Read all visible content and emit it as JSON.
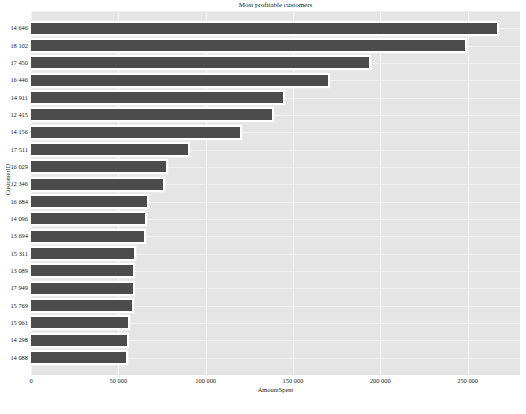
{
  "chart_data": {
    "type": "bar",
    "orientation": "horizontal",
    "title": "Most profitable customers",
    "xlabel": "AmountSpent",
    "ylabel": "CustomerID",
    "categories": [
      "14 646",
      "18 102",
      "17 450",
      "16 446",
      "14 911",
      "12 415",
      "14 156",
      "17 511",
      "16 029",
      "12 346",
      "16 684",
      "14 096",
      "13 694",
      "15 311",
      "13 089",
      "17 949",
      "15 769",
      "15 061",
      "14 298",
      "14 088"
    ],
    "values": [
      267000,
      248500,
      193500,
      170000,
      144300,
      138000,
      119700,
      90000,
      77300,
      75600,
      66300,
      65300,
      64800,
      58900,
      58400,
      58200,
      57600,
      55800,
      55200,
      54600
    ],
    "xlim": [
      0,
      280000
    ],
    "xticks": [
      0,
      50000,
      100000,
      150000,
      200000,
      250000
    ],
    "xticklabels": [
      "0",
      "50 000",
      "100 000",
      "150 000",
      "200 000",
      "250 000"
    ],
    "grid": true,
    "legend": null,
    "bar_color": "#4c4c4c",
    "plot_background": "#e5e5e5",
    "figure_background": "#ffffff",
    "gridline_color": "#f4f4f4"
  }
}
